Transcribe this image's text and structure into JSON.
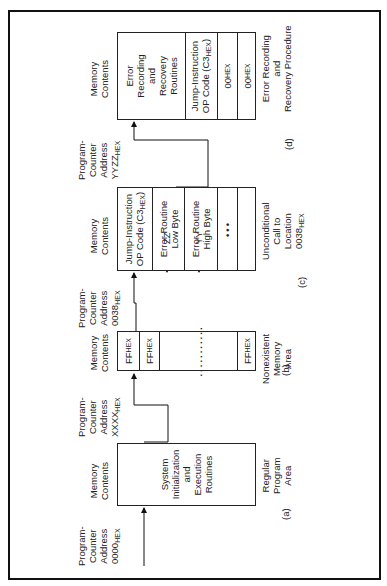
{
  "diagram": {
    "orientation": "rotated 90 degrees counter-clockwise",
    "headers": {
      "pc_address": "Program-Counter Address",
      "memory_contents": "Memory Contents"
    },
    "panels": [
      {
        "id": "a",
        "label": "(a)",
        "pc_address": "0000",
        "pc_suffix": "HEX",
        "cells": [
          "System Initialization and Execution Routines"
        ],
        "caption": "Regular Program Area"
      },
      {
        "id": "b",
        "label": "(b)",
        "pc_address": "XXXX",
        "pc_suffix": "HEX",
        "cells": [
          "FF HEX",
          "FF HEX",
          "...........",
          "FF HEX"
        ],
        "caption": "Nonexistent Memory Area"
      },
      {
        "id": "c",
        "label": "(c)",
        "pc_address": "0038",
        "pc_suffix": "HEX",
        "cells": [
          "Jump-Instruction OP Code (C3 HEX)",
          "Error Routine Low Byte",
          "Error Routine High Byte",
          "•••",
          ""
        ],
        "pointers": [
          "ZZ",
          "YY"
        ],
        "caption": "Unconditional Call to Location 0038 HEX"
      },
      {
        "id": "d",
        "label": "(d)",
        "pc_address": "YYZZ",
        "pc_suffix": "HEX",
        "cells": [
          "Error Recording and Recovery Routines",
          "Jump-Instruction OP Code (C3 HEX)",
          "00 HEX",
          "00 HEX"
        ],
        "caption": "Error Recording and Recovery Procedure"
      }
    ],
    "text": {
      "pc1": "Program-",
      "pc2": "Counter",
      "pc3": "Address",
      "mc1": "Memory",
      "mc2": "Contents",
      "hex": "HEX",
      "a_addr": "0000",
      "b_addr": "XXXX",
      "c_addr": "0038",
      "d_addr": "YYZZ",
      "a_cell1": "System",
      "a_cell2": "Initialization",
      "a_cell3": "and",
      "a_cell4": "Execution",
      "a_cell5": "Routines",
      "a_cap1": "Regular",
      "a_cap2": "Program",
      "a_cap3": "Area",
      "a_label": "(a)",
      "ff": "FF",
      "dotsrow": "...........",
      "b_cap1": "Nonexistent",
      "b_cap2": "Memory",
      "b_cap3": "Area",
      "b_label": "(b)",
      "jump1": "Jump-Instruction",
      "jump2": "OP Code (C3",
      "jump2b": ")",
      "err_low1": "Error Routine",
      "err_low2": "Low Byte",
      "err_high1": "Error Routine",
      "err_high2": "High Byte",
      "ellipsis": "•••",
      "zz": "ZZ",
      "yy": "YY",
      "c_cap1": "Unconditional",
      "c_cap2": "Call to",
      "c_cap3": "Location",
      "c_cap4": "0038",
      "c_label": "(c)",
      "d_cell1": "Error",
      "d_cell2": "Recording",
      "d_cell3": "and",
      "d_cell4": "Recovery",
      "d_cell5": "Routines",
      "zero": "00",
      "d_cap1": "Error Recording",
      "d_cap2": "and",
      "d_cap3": "Recovery Procedure",
      "d_label": "(d)"
    }
  }
}
